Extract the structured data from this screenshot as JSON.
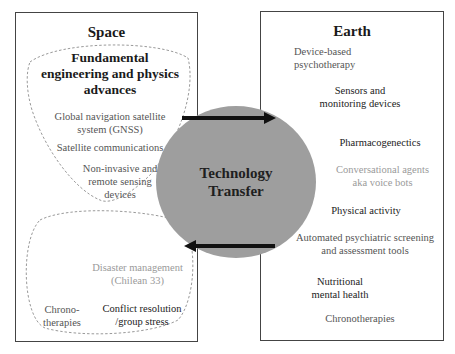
{
  "space": {
    "title": "Space",
    "fundamental": {
      "heading": "Fundamental engineering and physics advances",
      "heading_lines": [
        "Fundamental",
        "engineering and physics",
        "advances"
      ],
      "items": [
        {
          "lines": [
            "Global navigation satellite",
            "system (GNSS)"
          ],
          "tone": "mid"
        },
        {
          "lines": [
            "Satellite communications"
          ],
          "tone": "mid"
        },
        {
          "lines": [
            "Non-invasive and",
            "remote sensing",
            "devices"
          ],
          "tone": "mid"
        }
      ]
    },
    "applications": {
      "items": [
        {
          "lines": [
            "Disaster management",
            "(Chilean 33)"
          ],
          "tone": "light"
        },
        {
          "lines": [
            "Chrono-",
            "therapies"
          ],
          "tone": "mid"
        },
        {
          "lines": [
            "Conflict resolution",
            "/group stress"
          ],
          "tone": "dark"
        }
      ]
    }
  },
  "center": {
    "label_lines": [
      "Technology",
      "Transfer"
    ],
    "fill_color": "#9e9e9e"
  },
  "earth": {
    "title": "Earth",
    "items": [
      {
        "lines": [
          "Device-based",
          "psychotherapy"
        ],
        "tone": "mid"
      },
      {
        "lines": [
          "Sensors and",
          "monitoring devices"
        ],
        "tone": "dark"
      },
      {
        "lines": [
          "Pharmacogenectics"
        ],
        "tone": "dark"
      },
      {
        "lines": [
          "Conversational agents",
          "aka voice bots"
        ],
        "tone": "light"
      },
      {
        "lines": [
          "Physical activity"
        ],
        "tone": "dark"
      },
      {
        "lines": [
          "Automated psychiatric screening",
          "and assessment tools"
        ],
        "tone": "mid"
      },
      {
        "lines": [
          "Nutritional",
          "mental health"
        ],
        "tone": "dark"
      },
      {
        "lines": [
          "Chronotherapies"
        ],
        "tone": "mid"
      }
    ]
  },
  "arrows": {
    "top": {
      "direction": "space-to-earth"
    },
    "bottom": {
      "direction": "earth-to-space"
    }
  },
  "colors": {
    "border": "#444444",
    "circle": "#9e9e9e",
    "arrow": "#111111",
    "dashed": "#9a9a9a"
  }
}
